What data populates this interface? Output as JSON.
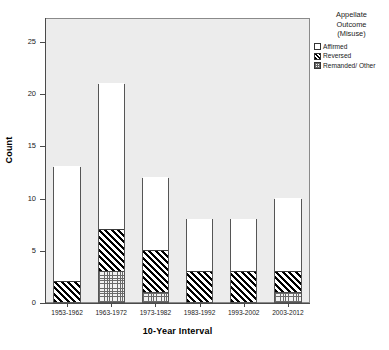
{
  "chart_data": {
    "type": "bar",
    "stacked": true,
    "title": "",
    "xlabel": "10-Year Interval",
    "ylabel": "Count",
    "categories": [
      "1953-1962",
      "1963-1972",
      "1973-1982",
      "1983-1992",
      "1993-2002",
      "2003-2012"
    ],
    "series": [
      {
        "name": "Remanded/ Other",
        "values": [
          0,
          3,
          1,
          0,
          0,
          1
        ],
        "pattern": "dotted"
      },
      {
        "name": "Reversed",
        "values": [
          2,
          4,
          4,
          3,
          3,
          2
        ],
        "pattern": "diagonal-hatch"
      },
      {
        "name": "Affirmed",
        "values": [
          11,
          14,
          7,
          5,
          5,
          7
        ],
        "pattern": "solid-white"
      }
    ],
    "totals": [
      13,
      21,
      12,
      8,
      8,
      10
    ],
    "ylim": [
      0,
      27.3
    ],
    "yticks": [
      0,
      5,
      10,
      15,
      20,
      25
    ],
    "ytick_labels": [
      "0",
      "5",
      "10",
      "15",
      "20",
      "25"
    ],
    "grid": false,
    "legend_position": "right-top",
    "colors": {
      "plot_background": "#ececec",
      "figure_background": "#ffffff",
      "axis": "#4a4a4a",
      "bar_outline": "#555555",
      "hatch": "#000000",
      "dots": "#6a6a6a"
    }
  },
  "axes": {
    "y_title": "Count",
    "x_title": "10-Year Interval",
    "y_tick_labels": [
      "0",
      "5",
      "10",
      "15",
      "20",
      "25"
    ],
    "x_tick_labels": [
      "1953-1962",
      "1963-1972",
      "1973-1982",
      "1983-1992",
      "1993-2002",
      "2003-2012"
    ]
  },
  "legend": {
    "title_lines": [
      "Appellate",
      "Outcome",
      "(Misuse)"
    ],
    "items": [
      {
        "label": "Affirmed"
      },
      {
        "label": "Reversed"
      },
      {
        "label": "Remanded/ Other"
      }
    ]
  }
}
